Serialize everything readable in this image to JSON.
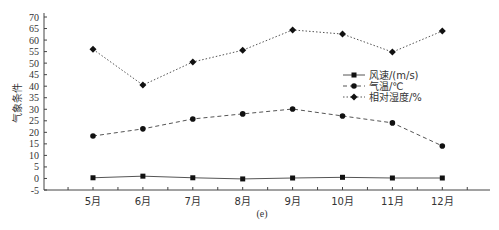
{
  "chart_data": {
    "type": "line",
    "title": "",
    "caption": "(e)",
    "xlabel": "",
    "ylabel": "气象条件",
    "ylim": [
      -5,
      70
    ],
    "yticks": [
      -5,
      0,
      5,
      10,
      15,
      20,
      25,
      30,
      35,
      40,
      45,
      50,
      55,
      60,
      65,
      70
    ],
    "categories": [
      "5月",
      "6月",
      "7月",
      "8月",
      "9月",
      "10月",
      "11月",
      "12月"
    ],
    "grid": false,
    "legend_position": "right-middle",
    "series": [
      {
        "name": "风速/(m/s)",
        "style": "solid",
        "marker": "square",
        "values": [
          0.3,
          1.0,
          0.3,
          -0.2,
          0.2,
          0.5,
          0.2,
          0.2
        ]
      },
      {
        "name": "气温/℃",
        "style": "dashed",
        "marker": "circle",
        "values": [
          18.4,
          21.5,
          25.8,
          28.0,
          30.1,
          27.1,
          24.1,
          14.1
        ]
      },
      {
        "name": "相对湿度/%",
        "style": "dotted",
        "marker": "diamond",
        "values": [
          56.0,
          40.5,
          50.5,
          55.6,
          64.4,
          62.6,
          54.8,
          63.9
        ]
      }
    ]
  }
}
